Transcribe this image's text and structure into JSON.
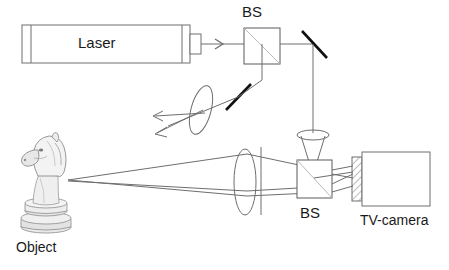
{
  "figure": {
    "background_color": "#ffffff",
    "line_color": "#6e6e6e",
    "dark_line_color": "#1a1a1a",
    "text_color": "#1a1a1a",
    "width": 449,
    "height": 270
  },
  "labels": {
    "laser": "Laser",
    "bs_top": "BS",
    "bs_bottom": "BS",
    "tv_camera": "TV-camera",
    "object": "Object"
  },
  "components": [
    {
      "name": "laser-source",
      "label": "Laser",
      "kind": "box",
      "x": 22,
      "y": 25,
      "w": 168,
      "h": 38
    },
    {
      "name": "laser-output-port",
      "label": "",
      "kind": "box",
      "x": 190,
      "y": 34,
      "w": 12,
      "h": 20
    },
    {
      "name": "beam-splitter-top",
      "label": "BS",
      "kind": "cube-splitter",
      "x": 244,
      "y": 28,
      "w": 36,
      "h": 36
    },
    {
      "name": "mirror-top-right",
      "label": "",
      "kind": "mirror",
      "x1": 302,
      "y1": 32,
      "x2": 326,
      "y2": 58
    },
    {
      "name": "mirror-mid",
      "label": "",
      "kind": "mirror",
      "x1": 249,
      "y1": 86,
      "x2": 226,
      "y2": 110
    },
    {
      "name": "lens-expander",
      "label": "",
      "kind": "lens-tilted",
      "cx": 201,
      "cy": 111,
      "rx": 10,
      "ry": 25,
      "rot": 20
    },
    {
      "name": "imaging-lens",
      "label": "",
      "kind": "lens-vertical",
      "cx": 245,
      "cy": 182,
      "rx": 11,
      "ry": 33
    },
    {
      "name": "aperture-stop",
      "label": "",
      "kind": "line-vertical",
      "x": 261,
      "y1": 148,
      "y2": 215
    },
    {
      "name": "collimator-lens",
      "label": "",
      "kind": "lens-horizontal",
      "cx": 313,
      "cy": 135,
      "rx": 16,
      "ry": 5
    },
    {
      "name": "beam-splitter-bottom",
      "label": "BS",
      "kind": "cube-splitter",
      "x": 297,
      "y": 160,
      "w": 35,
      "h": 38
    },
    {
      "name": "camera-sensor",
      "label": "",
      "kind": "hatched",
      "x": 352,
      "y": 157,
      "w": 10,
      "h": 44
    },
    {
      "name": "tv-camera-body",
      "label": "TV-camera",
      "kind": "box",
      "x": 362,
      "y": 152,
      "w": 68,
      "h": 54
    },
    {
      "name": "object-chess-knight",
      "label": "Object",
      "kind": "image",
      "x": 16,
      "y": 135,
      "w": 62,
      "h": 100
    }
  ],
  "beams": [
    {
      "name": "laser-to-bs",
      "from": "laser-output-port",
      "to": "beam-splitter-top",
      "arrow": true
    },
    {
      "name": "bs-to-mirror-right",
      "from": "beam-splitter-top",
      "to": "mirror-top-right",
      "arrow": false
    },
    {
      "name": "bs-down-to-mirror-mid",
      "from": "beam-splitter-top",
      "to": "mirror-mid",
      "arrow": false
    },
    {
      "name": "mirror-mid-to-lens",
      "from": "mirror-mid",
      "to": "lens-expander",
      "arrow": false
    },
    {
      "name": "expanded-beam-upper",
      "from": "lens-expander",
      "to": "object-chess-knight",
      "arrow": true
    },
    {
      "name": "expanded-beam-lower",
      "from": "lens-expander",
      "to": "object-chess-knight",
      "arrow": true
    },
    {
      "name": "mirror-right-down",
      "from": "mirror-top-right",
      "to": "collimator-lens",
      "arrow": false
    },
    {
      "name": "reference-beam-down",
      "from": "collimator-lens",
      "to": "beam-splitter-bottom",
      "arrow": false
    },
    {
      "name": "object-beam-to-lens",
      "from": "object-chess-knight",
      "to": "imaging-lens",
      "arrow": false
    },
    {
      "name": "lens-to-bs-bottom",
      "from": "imaging-lens",
      "to": "beam-splitter-bottom",
      "arrow": false
    },
    {
      "name": "bs-to-camera",
      "from": "beam-splitter-bottom",
      "to": "camera-sensor",
      "arrow": false
    }
  ]
}
